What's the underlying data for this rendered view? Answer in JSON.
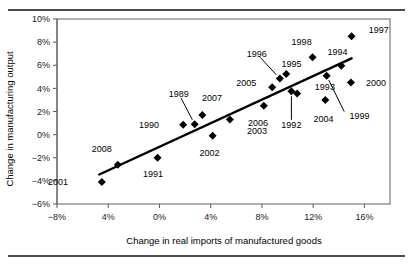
{
  "figure": {
    "top_rule": true,
    "bottom_rule": true
  },
  "chart_data": {
    "type": "scatter",
    "title": "",
    "xlabel": "Change in real imports of manufactured goods",
    "ylabel": "Change in manufacturing output",
    "xlim": [
      -8,
      18
    ],
    "ylim": [
      -6,
      10
    ],
    "xticks": [
      -8,
      -4,
      0,
      4,
      8,
      12,
      16
    ],
    "xticklabels": [
      "−8%",
      "4%",
      "0%",
      "4%",
      "8%",
      "12%",
      "16%"
    ],
    "yticks": [
      -6,
      -4,
      -2,
      0,
      2,
      4,
      6,
      8,
      10
    ],
    "yticklabels": [
      "−6%",
      "−4%",
      "−2%",
      "0%",
      "2%",
      "4%",
      "6%",
      "8%",
      "10%"
    ],
    "grid": false,
    "legend": "none",
    "trendline": {
      "x0": -4.7,
      "y0": -3.45,
      "x1": 15.0,
      "y1": 6.6
    },
    "points": [
      {
        "label": "2001",
        "x": -4.5,
        "y": -4.1,
        "lx": -6.9,
        "ly": -4.1,
        "anchor": "end",
        "leader": false
      },
      {
        "label": "2008",
        "x": -3.25,
        "y": -2.6,
        "lx": -4.5,
        "ly": -1.25,
        "anchor": "middle",
        "leader": false
      },
      {
        "label": "1991",
        "x": -0.15,
        "y": -2.0,
        "lx": -0.5,
        "ly": -3.35,
        "anchor": "middle",
        "leader": false
      },
      {
        "label": "1990",
        "x": 1.85,
        "y": 0.85,
        "lx": 0.2,
        "ly": 0.85,
        "anchor": "end",
        "leader": false
      },
      {
        "label": "1989",
        "x": 2.75,
        "y": 0.9,
        "lx": 1.5,
        "ly": 3.55,
        "anchor": "middle",
        "leader": true
      },
      {
        "label": "2007",
        "x": 3.35,
        "y": 1.7,
        "lx": 4.1,
        "ly": 3.15,
        "anchor": "middle",
        "leader": false
      },
      {
        "label": "2002",
        "x": 4.15,
        "y": -0.1,
        "lx": 3.9,
        "ly": -1.55,
        "anchor": "middle",
        "leader": false
      },
      {
        "label": "2003",
        "x": 5.5,
        "y": 1.3,
        "lx": 6.6,
        "ly": 0.35,
        "anchor": "start",
        "leader": false
      },
      {
        "label": "2006",
        "x": 8.15,
        "y": 2.5,
        "lx": 7.7,
        "ly": 1.0,
        "anchor": "middle",
        "leader": false
      },
      {
        "label": "2005",
        "x": 8.8,
        "y": 4.1,
        "lx": 7.8,
        "ly": 4.45,
        "anchor": "end",
        "leader": false
      },
      {
        "label": "1996",
        "x": 9.4,
        "y": 4.85,
        "lx": 7.6,
        "ly": 7.0,
        "anchor": "middle",
        "leader": true
      },
      {
        "label": "1995",
        "x": 9.9,
        "y": 5.25,
        "lx": 9.3,
        "ly": 6.15,
        "anchor": "start",
        "leader": false
      },
      {
        "label": "1992",
        "x": 10.3,
        "y": 3.75,
        "lx": 10.3,
        "ly": 0.85,
        "anchor": "middle",
        "leader": true
      },
      {
        "label": "1993",
        "x": 10.75,
        "y": 3.55,
        "lx": 11.9,
        "ly": 4.1,
        "anchor": "start",
        "leader": false
      },
      {
        "label": "1998",
        "x": 11.95,
        "y": 6.7,
        "lx": 11.1,
        "ly": 8.0,
        "anchor": "middle",
        "leader": false
      },
      {
        "label": "2004",
        "x": 12.95,
        "y": 3.0,
        "lx": 12.8,
        "ly": 1.4,
        "anchor": "middle",
        "leader": false
      },
      {
        "label": "1994",
        "x": 14.2,
        "y": 5.95,
        "lx": 13.9,
        "ly": 7.2,
        "anchor": "middle",
        "leader": false
      },
      {
        "label": "1999",
        "x": 13.05,
        "y": 5.1,
        "lx": 14.6,
        "ly": 1.6,
        "anchor": "start",
        "leader": true
      },
      {
        "label": "2000",
        "x": 14.95,
        "y": 4.5,
        "lx": 15.9,
        "ly": 4.5,
        "anchor": "start",
        "leader": false
      },
      {
        "label": "1997",
        "x": 15.0,
        "y": 8.5,
        "lx": 16.1,
        "ly": 9.1,
        "anchor": "start",
        "leader": false
      }
    ]
  }
}
